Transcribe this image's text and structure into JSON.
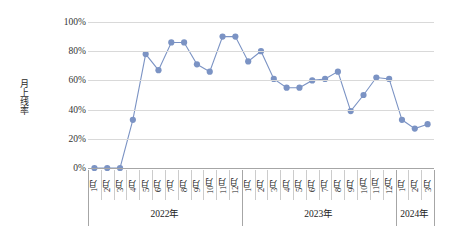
{
  "chart_data": {
    "type": "line",
    "title": "",
    "xlabel": "",
    "ylabel": "月上线率",
    "ylim": [
      0,
      100
    ],
    "yunit": "%",
    "grid": true,
    "legend": "none",
    "series_color": "#7b93c4",
    "ytick_labels": [
      "100%",
      "80%",
      "60%",
      "40%",
      "20%",
      "0%"
    ],
    "ytick_values": [
      100,
      80,
      60,
      40,
      20,
      0
    ],
    "groups": [
      {
        "label": "2022年",
        "count": 12
      },
      {
        "label": "2023年",
        "count": 12
      },
      {
        "label": "2024年",
        "count": 3
      }
    ],
    "categories": [
      "1月",
      "2月",
      "3月",
      "4月",
      "5月",
      "6月",
      "7月",
      "8月",
      "9月",
      "10月",
      "11月",
      "12月",
      "1月",
      "2月",
      "3月",
      "4月",
      "5月",
      "6月",
      "7月",
      "8月",
      "9月",
      "10月",
      "11月",
      "12月",
      "1月",
      "2月",
      "3月"
    ],
    "series": [
      {
        "name": "月上线率",
        "values": [
          0,
          0,
          0,
          33,
          78,
          67,
          86,
          86,
          71,
          66,
          90,
          90,
          73,
          80,
          61,
          55,
          55,
          60,
          61,
          66,
          39,
          50,
          62,
          61,
          33,
          27,
          30
        ]
      }
    ]
  }
}
